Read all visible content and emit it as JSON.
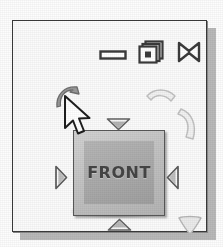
{
  "widget": {
    "name": "view-orientation-widget",
    "cube": {
      "face_label": "FRONT",
      "face_color": "#c2c2c2",
      "inner_color": "#a9a9a9",
      "text_color": "#454545"
    },
    "panel": {
      "background": "#fbfbfb",
      "border_color": "#3a3a3a",
      "shadow_color": "#b9b9b9"
    }
  },
  "window_controls": [
    {
      "id": "minimize",
      "icon": "minimize-icon",
      "label": "Minimize"
    },
    {
      "id": "restore",
      "icon": "restore-icon",
      "label": "Restore"
    },
    {
      "id": "close",
      "icon": "close-icon",
      "label": "Close"
    }
  ],
  "direction_arrows": [
    {
      "id": "top",
      "icon": "triangle-down-icon",
      "label": "Rotate up"
    },
    {
      "id": "bottom",
      "icon": "triangle-up-icon",
      "label": "Rotate down"
    },
    {
      "id": "left",
      "icon": "triangle-right-icon",
      "label": "Rotate left"
    },
    {
      "id": "right",
      "icon": "triangle-left-icon",
      "label": "Rotate right"
    }
  ],
  "rotation_arrows": [
    {
      "id": "top-left",
      "icon": "curved-arrow-icon",
      "label": "Roll counter-clockwise",
      "state": "highlighted",
      "color": "#8f8f8f"
    },
    {
      "id": "top-right-a",
      "icon": "curved-arrow-icon",
      "label": "Roll clockwise",
      "state": "normal",
      "color": "#d9d9d9"
    },
    {
      "id": "top-right-b",
      "icon": "curved-arrow-icon",
      "label": "Roll clockwise",
      "state": "normal",
      "color": "#d9d9d9"
    },
    {
      "id": "bottom-right",
      "icon": "curved-arrow-icon",
      "label": "Roll",
      "state": "normal",
      "color": "#d0d0d0"
    }
  ],
  "cursor": {
    "icon": "mouse-pointer-icon",
    "label": "Mouse pointer",
    "x": 49,
    "y": 73
  }
}
